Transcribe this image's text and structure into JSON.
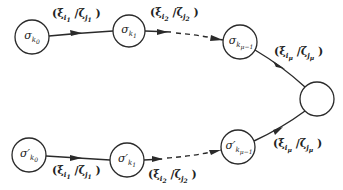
{
  "figure": {
    "stroke_color": "#2a2a2a",
    "background": "#ffffff"
  },
  "nodes": [
    {
      "id": "top-0",
      "symbol": "σ",
      "prime": "",
      "sub": "k",
      "subsub": "0",
      "cx": 32,
      "cy": 37,
      "r": 17
    },
    {
      "id": "top-1",
      "symbol": "σ",
      "prime": "",
      "sub": "k",
      "subsub": "1",
      "cx": 129,
      "cy": 31,
      "r": 16
    },
    {
      "id": "top-mu",
      "symbol": "σ",
      "prime": "",
      "sub": "k",
      "subsub": "μ−1",
      "cx": 240,
      "cy": 42,
      "r": 17
    },
    {
      "id": "final",
      "symbol": "",
      "prime": "",
      "sub": "",
      "subsub": "",
      "cx": 317,
      "cy": 99,
      "r": 17
    },
    {
      "id": "bot-0",
      "symbol": "σ",
      "prime": "′",
      "sub": "k",
      "subsub": "0",
      "cx": 29,
      "cy": 155,
      "r": 17
    },
    {
      "id": "bot-1",
      "symbol": "σ",
      "prime": "′",
      "sub": "k",
      "subsub": "1",
      "cx": 127,
      "cy": 160,
      "r": 17
    },
    {
      "id": "bot-mu",
      "symbol": "σ",
      "prime": "′",
      "sub": "k",
      "subsub": "μ−1",
      "cx": 238,
      "cy": 147,
      "r": 17
    }
  ],
  "edge_labels": [
    {
      "id": "top-e1",
      "open": "(ξ",
      "a_sub": "i",
      "a_subsub": "1",
      "sep": " /ζ",
      "b_sub": "j",
      "b_subsub": "1",
      "close": " )",
      "x": 52,
      "y": 8
    },
    {
      "id": "top-e2",
      "open": "(ξ",
      "a_sub": "i",
      "a_subsub": "2",
      "sep": " /ζ",
      "b_sub": "j",
      "b_subsub": "2",
      "close": " )",
      "x": 150,
      "y": 7
    },
    {
      "id": "top-emu",
      "open": "(ξ",
      "a_sub": "i",
      "a_subsub": "μ",
      "sep": " /ζ",
      "b_sub": "j",
      "b_subsub": "μ",
      "close": " )",
      "x": 274,
      "y": 46
    },
    {
      "id": "bot-e1",
      "open": "(ξ",
      "a_sub": "i",
      "a_subsub": "1",
      "sep": " /ζ",
      "b_sub": "j",
      "b_subsub": "1",
      "close": " )",
      "x": 52,
      "y": 165
    },
    {
      "id": "bot-e2",
      "open": "(ξ",
      "a_sub": "i",
      "a_subsub": "2",
      "sep": " /ζ",
      "b_sub": "j",
      "b_subsub": "2",
      "close": " )",
      "x": 148,
      "y": 169
    },
    {
      "id": "bot-emu",
      "open": "(ξ",
      "a_sub": "i",
      "a_subsub": "μ",
      "sep": " /ζ",
      "b_sub": "j",
      "b_subsub": "μ",
      "close": " )",
      "x": 273,
      "y": 138
    }
  ]
}
